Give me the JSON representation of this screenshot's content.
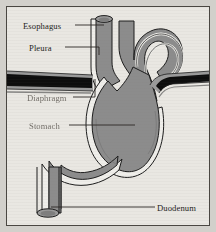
{
  "figure": {
    "style": "grayscale line drawing on aged paper"
  },
  "colors": {
    "page_background": "#d2d0cb",
    "plate_background": "#e9e7e2",
    "plate_border": "#4a4742",
    "organ_fill": "#8c8c8c",
    "organ_outline": "#1c1c1c",
    "serosa_band": "#efeeea",
    "diaphragm_dark": "#0d0d0d",
    "diaphragm_edge": "#9a9a9a",
    "leader_line": "#2a2724",
    "label_text": "#241f1c",
    "label_text_faded": "#55504a"
  },
  "labels": [
    {
      "id": "esophagus",
      "text": "Esophagus",
      "faded": false
    },
    {
      "id": "pleura",
      "text": "Pleura",
      "faded": false
    },
    {
      "id": "diaphragm",
      "text": "Diaphragm",
      "faded": true
    },
    {
      "id": "stomach",
      "text": "Stomach",
      "faded": true
    },
    {
      "id": "duodenum",
      "text": "Duodenum",
      "faded": false
    }
  ],
  "structures": [
    {
      "name": "esophagus",
      "description": "vertical tube entering from top with elliptical cut rim"
    },
    {
      "name": "fundus",
      "description": "arched dome at upper right with concentric serosa bands"
    },
    {
      "name": "stomach-body",
      "description": "large gray curved sac occupying the center"
    },
    {
      "name": "diaphragm",
      "description": "dark horizontal band crossing left and right of the stomach"
    },
    {
      "name": "pleura",
      "description": "thin lining layer above the diaphragm"
    },
    {
      "name": "duodenum",
      "description": "tube descending at lower left with elliptical cut end"
    }
  ]
}
